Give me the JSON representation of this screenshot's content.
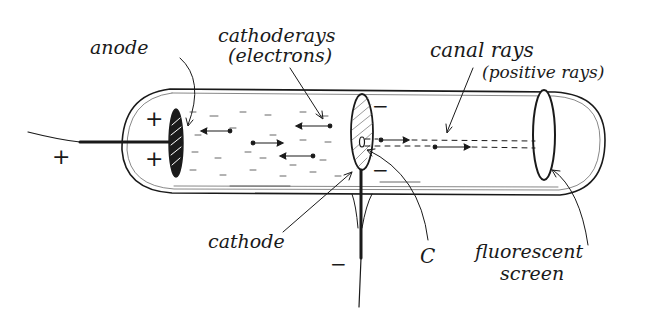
{
  "diagram": {
    "labels": {
      "anode": "anode",
      "cathode_rays": "cathoderays",
      "cathode_rays_sub": "(electrons)",
      "canal_rays": "canal rays",
      "canal_rays_sub": "(positive rays)",
      "cathode": "cathode",
      "c": "C",
      "fluorescent": "fluorescent",
      "screen": "screen"
    },
    "signs": {
      "anode_wire": "+",
      "anode_top": "+",
      "anode_bottom": "+",
      "cathode_top": "−",
      "cathode_bottom": "−",
      "cathode_wire": "−"
    },
    "colors": {
      "ink": "#1a1a1a",
      "background": "#ffffff"
    }
  }
}
